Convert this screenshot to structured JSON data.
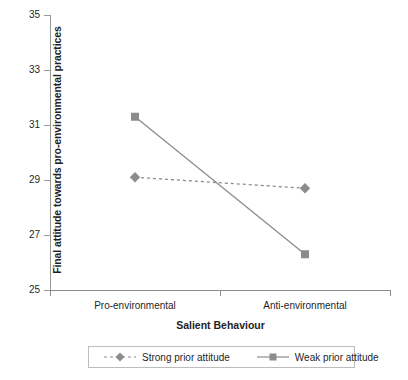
{
  "chart_data": {
    "type": "line",
    "title": "",
    "xlabel": "Salient Behaviour",
    "ylabel": "Final attitude towards pro-environmental practices",
    "categories": [
      "Pro-environmental",
      "Anti-environmental"
    ],
    "ylim": [
      25,
      35
    ],
    "yticks": [
      25,
      27,
      29,
      31,
      33,
      35
    ],
    "ytick_labels": [
      "25",
      "27",
      "29",
      "31",
      "33",
      "35"
    ],
    "grid": false,
    "legend_position": "bottom",
    "series": [
      {
        "name": "Strong prior attitude",
        "values": [
          29.1,
          28.7
        ],
        "marker": "diamond",
        "linestyle": "dashed",
        "color": "#8c8c8c"
      },
      {
        "name": "Weak prior attitude",
        "values": [
          31.3,
          26.3
        ],
        "marker": "square",
        "linestyle": "solid",
        "color": "#8c8c8c"
      }
    ]
  },
  "axes": {
    "y_title": "Final attitude towards pro-environmental practices",
    "x_title": "Salient Behaviour",
    "y_tick_labels": [
      "35",
      "33",
      "31",
      "29",
      "27",
      "25"
    ],
    "x_tick_labels": [
      "Pro-environmental",
      "Anti-environmental"
    ]
  },
  "legend": {
    "items": [
      {
        "label": "Strong prior attitude",
        "marker": "diamond",
        "style": "dashed"
      },
      {
        "label": "Weak prior attitude",
        "marker": "square",
        "style": "solid"
      }
    ]
  },
  "colors": {
    "series": "#8c8c8c",
    "axis": "#8c8c8c",
    "text": "#1f1f1f",
    "legend_border": "#bdbdbd",
    "background": "#ffffff"
  }
}
